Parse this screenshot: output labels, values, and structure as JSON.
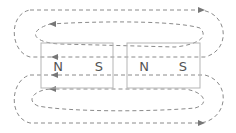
{
  "diagram": {
    "magnets": [
      {
        "id": "magnet-1",
        "pole_left": "N",
        "pole_right": "S",
        "x": 41,
        "y": 43,
        "w": 72,
        "h": 45
      },
      {
        "id": "magnet-2",
        "pole_left": "N",
        "pole_right": "S",
        "x": 127,
        "y": 43,
        "w": 73,
        "h": 45
      }
    ],
    "colors": {
      "field_line": "#8a8a8a",
      "magnet_outline": "#b5b5b5",
      "label": "#555555"
    }
  }
}
